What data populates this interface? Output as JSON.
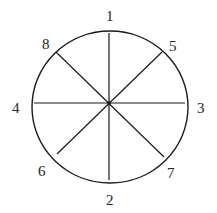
{
  "diagram": {
    "type": "circle-with-radial-lines",
    "stroke_color": "#1a1a1a",
    "background": "#ffffff",
    "circle": {
      "cx": 110,
      "cy": 107,
      "rx": 78,
      "ry": 76
    },
    "center": {
      "x": 109,
      "y": 103
    },
    "labels": [
      {
        "id": "1",
        "text": "1",
        "x": 106,
        "y": 21,
        "position": "top"
      },
      {
        "id": "2",
        "text": "2",
        "x": 106,
        "y": 205,
        "position": "bottom"
      },
      {
        "id": "3",
        "text": "3",
        "x": 197,
        "y": 113,
        "position": "right"
      },
      {
        "id": "4",
        "text": "4",
        "x": 12,
        "y": 113,
        "position": "left"
      },
      {
        "id": "5",
        "text": "5",
        "x": 169,
        "y": 51,
        "position": "upper-right"
      },
      {
        "id": "6",
        "text": "6",
        "x": 38,
        "y": 176,
        "position": "lower-left"
      },
      {
        "id": "7",
        "text": "7",
        "x": 167,
        "y": 178,
        "position": "lower-right"
      },
      {
        "id": "8",
        "text": "8",
        "x": 42,
        "y": 49,
        "position": "upper-left"
      }
    ],
    "lines": [
      {
        "name": "line-1-2",
        "x1": 109,
        "y1": 33,
        "x2": 109,
        "y2": 180
      },
      {
        "name": "line-4-3",
        "x1": 34,
        "y1": 103,
        "x2": 185,
        "y2": 103
      },
      {
        "name": "line-8-7",
        "x1": 56,
        "y1": 52,
        "x2": 164,
        "y2": 157
      },
      {
        "name": "line-5-6",
        "x1": 162,
        "y1": 52,
        "x2": 57,
        "y2": 154
      }
    ]
  }
}
